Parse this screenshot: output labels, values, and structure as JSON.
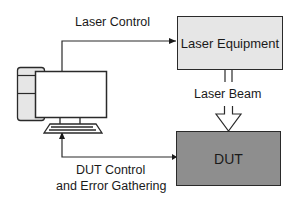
{
  "diagram": {
    "type": "block-diagram",
    "nodes": {
      "computer": {
        "label": "",
        "icon": "desktop-computer-icon"
      },
      "laser_equipment": {
        "label": "Laser Equipment",
        "fill": "#e6e6e6"
      },
      "dut": {
        "label": "DUT",
        "fill": "#8e8e8e"
      }
    },
    "edges": {
      "laser_control": {
        "label": "Laser Control",
        "from": "computer",
        "to": "laser_equipment"
      },
      "laser_beam": {
        "label": "Laser Beam",
        "from": "laser_equipment",
        "to": "dut"
      },
      "dut_control": {
        "label_line1": "DUT Control",
        "label_line2": "and Error Gathering",
        "from": "dut",
        "to": "computer"
      }
    },
    "colors": {
      "line": "#2a2a2a",
      "computer_fill": "#e6e6e6",
      "background": "#ffffff"
    }
  }
}
